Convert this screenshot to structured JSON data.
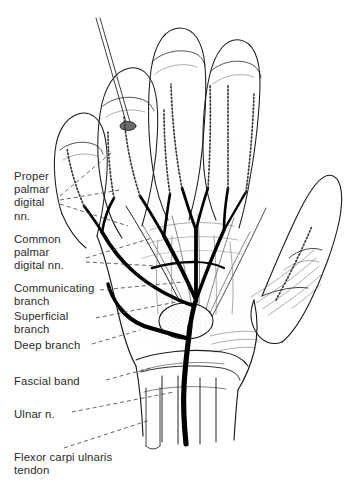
{
  "figure": {
    "style": "pen-and-ink anatomical line drawing",
    "background_color": "#ffffff",
    "ink_color": "#1a1a1a",
    "text_color": "#2b2b2b",
    "nerve_color": "#000000",
    "leader_style": "dashed"
  },
  "labels": [
    {
      "id": "proper-palmar-digital",
      "text": "Proper\npalmar\ndigital\nnn.",
      "x": 14,
      "y": 170
    },
    {
      "id": "common-palmar-digital",
      "text": "Common\npalmar\ndigital nn.",
      "x": 14,
      "y": 233
    },
    {
      "id": "communicating-branch",
      "text": "Communicating\nbranch",
      "x": 14,
      "y": 282
    },
    {
      "id": "superficial-branch",
      "text": "Superficial\nbranch",
      "x": 14,
      "y": 310
    },
    {
      "id": "deep-branch",
      "text": "Deep branch",
      "x": 14,
      "y": 339
    },
    {
      "id": "fascial-band",
      "text": "Fascial band",
      "x": 14,
      "y": 375
    },
    {
      "id": "ulnar-nerve",
      "text": "Ulnar n.",
      "x": 14,
      "y": 408
    },
    {
      "id": "flexor-carpi-ulnaris-tendon",
      "text": "Flexor carpi ulnaris\ntendon",
      "x": 14,
      "y": 451
    }
  ]
}
